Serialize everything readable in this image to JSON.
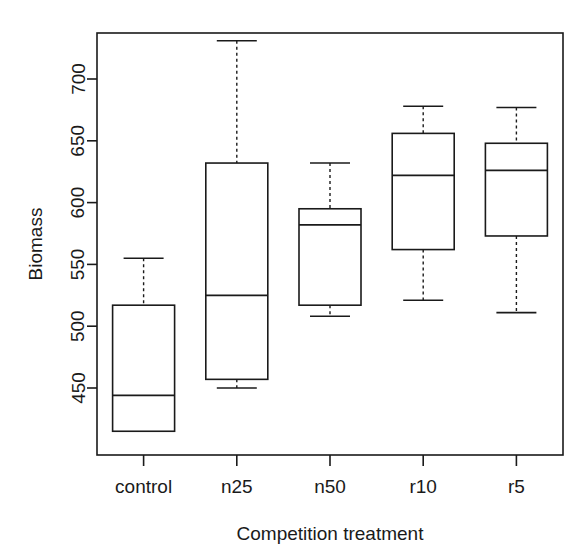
{
  "chart_data": {
    "type": "boxplot",
    "title": "",
    "xlabel": "Competition treatment",
    "ylabel": "Biomass",
    "categories": [
      "control",
      "n25",
      "n50",
      "r10",
      "r5"
    ],
    "ytick_labels": [
      "450",
      "500",
      "550",
      "600",
      "650",
      "700"
    ],
    "ytick_values": [
      450,
      500,
      550,
      600,
      650,
      700
    ],
    "ylim": [
      410,
      740
    ],
    "grid": false,
    "legend": false,
    "boxes": [
      {
        "category": "control",
        "whisker_low": 415,
        "q1": 415,
        "median": 444,
        "q3": 517,
        "whisker_high": 555
      },
      {
        "category": "n25",
        "whisker_low": 450,
        "q1": 457,
        "median": 525,
        "q3": 632,
        "whisker_high": 731
      },
      {
        "category": "n50",
        "whisker_low": 508,
        "q1": 517,
        "median": 582,
        "q3": 595,
        "whisker_high": 632
      },
      {
        "category": "r10",
        "whisker_low": 521,
        "q1": 562,
        "median": 622,
        "q3": 656,
        "whisker_high": 678
      },
      {
        "category": "r5",
        "whisker_low": 511,
        "q1": 573,
        "median": 626,
        "q3": 648,
        "whisker_high": 677
      }
    ]
  },
  "axis": {
    "y_label": "Biomass",
    "x_label": "Competition treatment"
  },
  "colors": {
    "line": "#1a1a1a",
    "background": "#ffffff",
    "box_fill": "#ffffff"
  }
}
